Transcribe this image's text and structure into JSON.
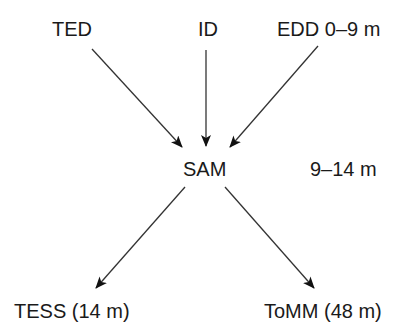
{
  "diagram": {
    "inputs": [
      {
        "id": "ted",
        "label": "TED"
      },
      {
        "id": "id",
        "label": "ID"
      },
      {
        "id": "edd",
        "label": "EDD 0–9 m"
      }
    ],
    "center": {
      "id": "sam",
      "label": "SAM",
      "age_label": "9–14 m"
    },
    "outputs": [
      {
        "id": "tess",
        "label": "TESS (14 m)"
      },
      {
        "id": "tomm",
        "label": "ToMM (48 m)"
      }
    ],
    "edges": [
      {
        "from": "ted",
        "to": "sam"
      },
      {
        "from": "id",
        "to": "sam"
      },
      {
        "from": "edd",
        "to": "sam"
      },
      {
        "from": "sam",
        "to": "tess"
      },
      {
        "from": "sam",
        "to": "tomm"
      }
    ],
    "colors": {
      "ink": "#1a1a1a",
      "background": "#ffffff"
    }
  }
}
